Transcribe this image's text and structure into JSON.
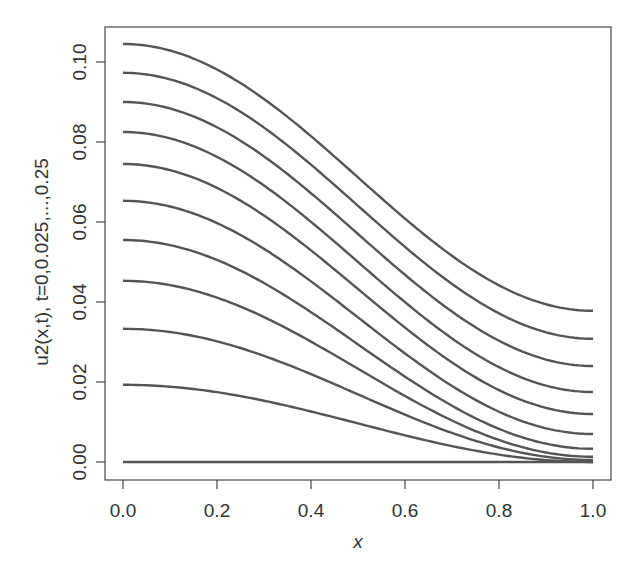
{
  "chart_data": {
    "type": "line",
    "title": "",
    "xlabel": "x",
    "ylabel": "u2(x,t), t=0,0.025,...,0.25",
    "xlim": [
      0.0,
      1.0
    ],
    "ylim": [
      0.0,
      0.105
    ],
    "x_ticks": [
      0.0,
      0.2,
      0.4,
      0.6,
      0.8,
      1.0
    ],
    "x_tick_labels": [
      "0.0",
      "0.2",
      "0.4",
      "0.6",
      "0.8",
      "1.0"
    ],
    "y_ticks": [
      0.0,
      0.02,
      0.04,
      0.06,
      0.08,
      0.1
    ],
    "y_tick_labels": [
      "0.00",
      "0.02",
      "0.04",
      "0.06",
      "0.08",
      "0.10"
    ],
    "grid": false,
    "legend": null,
    "line_color": "#555555",
    "x": [
      0.0,
      0.1,
      0.2,
      0.3,
      0.4,
      0.5,
      0.6,
      0.7,
      0.8,
      0.9,
      1.0
    ],
    "series": [
      {
        "name": "t=0",
        "start": 0.0,
        "end": 0.0
      },
      {
        "name": "t=0.025",
        "start": 0.0193,
        "end": 0.0
      },
      {
        "name": "t=0.05",
        "start": 0.0333,
        "end": 0.0005
      },
      {
        "name": "t=0.075",
        "start": 0.0453,
        "end": 0.0013
      },
      {
        "name": "t=0.1",
        "start": 0.0555,
        "end": 0.0033
      },
      {
        "name": "t=0.125",
        "start": 0.0653,
        "end": 0.007
      },
      {
        "name": "t=0.15",
        "start": 0.0745,
        "end": 0.012
      },
      {
        "name": "t=0.175",
        "start": 0.0825,
        "end": 0.0175
      },
      {
        "name": "t=0.2",
        "start": 0.09,
        "end": 0.024
      },
      {
        "name": "t=0.225",
        "start": 0.0973,
        "end": 0.0308
      },
      {
        "name": "t=0.25",
        "start": 0.1045,
        "end": 0.0378
      }
    ]
  }
}
